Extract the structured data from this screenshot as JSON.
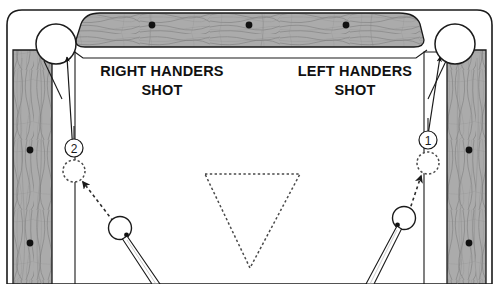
{
  "diagram": {
    "type": "billiards-shot-diagram",
    "colors": {
      "rail_wood": "#a8a8a8",
      "rail_wood_light": "#c9c9c9",
      "outline": "#1a1a1a",
      "cloth": "#ffffff",
      "diamond": "#111111",
      "pocket": "#ffffff",
      "dashed": "#3a3a3a"
    }
  },
  "labels": {
    "right_handers": {
      "line1": "RIGHT HANDERS",
      "line2": "SHOT"
    },
    "left_handers": {
      "line1": "LEFT HANDERS",
      "line2": "SHOT"
    }
  },
  "balls": {
    "left_object_ball_number": "2",
    "right_object_ball_number": "1"
  },
  "table": {
    "top_rail_diamonds": 3,
    "left_rail_diamonds": 2,
    "right_rail_diamonds": 2,
    "pockets": [
      {
        "name": "top-left-pocket"
      },
      {
        "name": "top-right-pocket"
      }
    ],
    "rack_shape": "triangle-dashed"
  },
  "shots": [
    {
      "name": "right-handers-shot",
      "side": "left",
      "object_ball": "2",
      "ghost_ball": "dashed-circle",
      "aim_line": "dashed-arrow",
      "cue_stick": true
    },
    {
      "name": "left-handers-shot",
      "side": "right",
      "object_ball": "1",
      "ghost_ball": "dashed-circle",
      "aim_line": "dashed-arrow",
      "cue_stick": true
    }
  ]
}
